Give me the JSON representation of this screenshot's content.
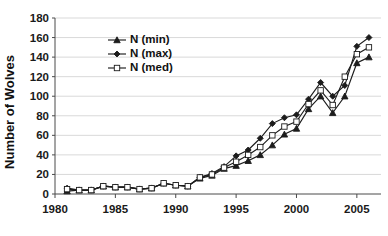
{
  "chart_data": {
    "type": "line",
    "title": "",
    "xlabel": "",
    "ylabel": "Number of Wolves",
    "xlim": [
      1980,
      2007
    ],
    "ylim": [
      0,
      180
    ],
    "ytick_step": 20,
    "yticks": [
      0,
      20,
      40,
      60,
      80,
      100,
      120,
      140,
      160,
      180
    ],
    "xticks": [
      1980,
      1985,
      1990,
      1995,
      2000,
      2005
    ],
    "xtick_labels": [
      "1980",
      "1985",
      "1990",
      "1995",
      "2000",
      "2005"
    ],
    "ytick_labels": [
      "0",
      "20",
      "40",
      "60",
      "80",
      "100",
      "120",
      "140",
      "160",
      "180"
    ],
    "grid": true,
    "grid_axis": "y",
    "legend_position": "upper-left-inside",
    "x": [
      1981,
      1982,
      1983,
      1984,
      1985,
      1986,
      1987,
      1988,
      1989,
      1990,
      1991,
      1992,
      1993,
      1994,
      1995,
      1996,
      1997,
      1998,
      1999,
      2000,
      2001,
      2002,
      2003,
      2004,
      2005,
      2006
    ],
    "series": [
      {
        "name": "N (min)",
        "marker": "triangle",
        "marker_fill": "filled",
        "values": [
          3,
          4,
          4,
          8,
          7,
          7,
          5,
          6,
          11,
          9,
          8,
          16,
          19,
          26,
          29,
          34,
          40,
          50,
          61,
          67,
          87,
          100,
          83,
          100,
          134,
          140
        ]
      },
      {
        "name": "N (max)",
        "marker": "diamond",
        "marker_fill": "filled",
        "values": [
          6,
          4,
          4,
          8,
          7,
          7,
          5,
          6,
          11,
          9,
          8,
          17,
          21,
          28,
          39,
          45,
          57,
          72,
          78,
          81,
          97,
          114,
          100,
          111,
          151,
          160
        ]
      },
      {
        "name": "N (med)",
        "marker": "square",
        "marker_fill": "open",
        "values": [
          5,
          4,
          4,
          8,
          7,
          7,
          5,
          6,
          11,
          9,
          8,
          17,
          20,
          27,
          33,
          40,
          48,
          60,
          69,
          74,
          92,
          106,
          91,
          120,
          143,
          150
        ]
      }
    ]
  },
  "legend": {
    "items": [
      {
        "label": "N (min)"
      },
      {
        "label": "N (max)"
      },
      {
        "label": "N (med)"
      }
    ]
  }
}
